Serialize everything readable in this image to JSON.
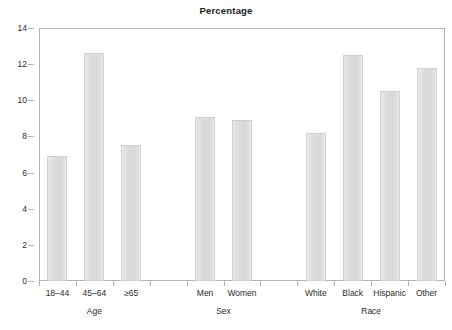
{
  "chart_data": {
    "type": "bar",
    "title": "Percentage",
    "xlabel": "",
    "ylabel": "",
    "ylim": [
      0,
      14
    ],
    "grid": false,
    "legend": null,
    "y_ticks": [
      0,
      2,
      4,
      6,
      8,
      10,
      12,
      14
    ],
    "y_tick_labels": [
      "0",
      "2",
      "4",
      "6",
      "8",
      "10",
      "12",
      "14"
    ],
    "categories": [
      "18–44",
      "45–64",
      "≥65",
      "Men",
      "Women",
      "White",
      "Black",
      "Hispanic",
      "Other"
    ],
    "values": [
      6.9,
      12.6,
      7.5,
      9.1,
      8.9,
      8.2,
      12.5,
      10.5,
      11.8
    ],
    "groups": [
      {
        "name": "Age",
        "categories": [
          "18–44",
          "45–64",
          "≥65"
        ],
        "values": [
          6.9,
          12.6,
          7.5
        ]
      },
      {
        "name": "Sex",
        "categories": [
          "Men",
          "Women"
        ],
        "values": [
          9.1,
          8.9
        ]
      },
      {
        "name": "Race",
        "categories": [
          "White",
          "Black",
          "Hispanic",
          "Other"
        ],
        "values": [
          8.2,
          12.5,
          10.5,
          11.8
        ]
      }
    ],
    "bar_color": "#dcdcdc",
    "bar_edge_color": "#d2d2d2",
    "axis_color": "#b4b4b4",
    "text_color": "#2b2b2b"
  }
}
